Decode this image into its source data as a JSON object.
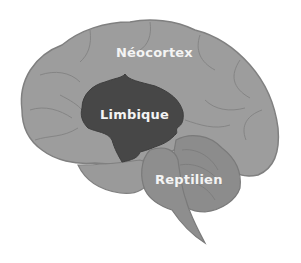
{
  "diagram": {
    "regions": [
      {
        "id": "neocortex",
        "label": "Néocortex",
        "color": "#9d9d9d"
      },
      {
        "id": "limbique",
        "label": "Limbique",
        "color": "#474747"
      },
      {
        "id": "reptilien",
        "label": "Reptilien",
        "color": "#8c8c8c"
      }
    ],
    "colors": {
      "background": "#ffffff",
      "outline": "#7f7f7f",
      "sulcus": "#858585",
      "text": "#f4f4f4"
    }
  }
}
